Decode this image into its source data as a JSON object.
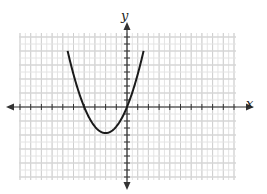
{
  "chart_data": {
    "type": "line",
    "title": "",
    "xlabel": "x",
    "ylabel": "y",
    "function": "parabola with x-intercepts at x = -4 and x = 0, vertex near (-2, -3)",
    "x_intercepts": [
      -4,
      0
    ],
    "vertex": [
      -2,
      -3
    ],
    "series": [
      {
        "name": "parabola",
        "x": [
          -5.5,
          -5,
          -4,
          -3,
          -2,
          -1,
          0,
          1,
          1.5
        ],
        "y": [
          7.0,
          3.75,
          0,
          -2.25,
          -3,
          -2.25,
          0,
          3.75,
          7.0
        ]
      }
    ],
    "xlim": [
      -10,
      10
    ],
    "ylim": [
      -10,
      10
    ],
    "grid": true,
    "legend": "none"
  },
  "labels": {
    "x_axis": "x",
    "y_axis": "y"
  },
  "colors": {
    "grid_minor": "#e4e4e4",
    "grid_major": "#cfcfcf",
    "axis": "#333333",
    "curve": "#1a1a1a"
  }
}
